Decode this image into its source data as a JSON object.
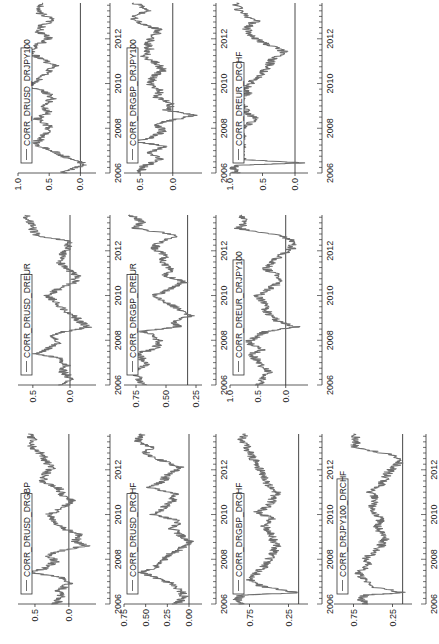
{
  "figure": {
    "orientation": "rotated-90-ccw",
    "line_color": "#6e6e6e",
    "axis_color": "#333333",
    "zero_line_color": "#333333"
  },
  "x_axis": {
    "ticks": [
      "2006",
      "2008",
      "2010",
      "2012"
    ],
    "range": [
      2006,
      2013.6
    ]
  },
  "chart_data": [
    {
      "type": "line",
      "title": "",
      "legend": "CORR_DRUSD_DRGBP",
      "column": 0,
      "row": 0,
      "ylim": [
        -0.4,
        0.75
      ],
      "yticks": [
        "0.5",
        "0.0"
      ],
      "ytick_values": [
        0.5,
        0.0
      ],
      "x": [
        2006.0,
        2006.3,
        2006.6,
        2006.9,
        2007.2,
        2007.4,
        2007.6,
        2007.9,
        2008.2,
        2008.4,
        2008.6,
        2008.8,
        2009.1,
        2009.4,
        2009.7,
        2010.0,
        2010.3,
        2010.6,
        2010.9,
        2011.2,
        2011.5,
        2011.8,
        2012.1,
        2012.4,
        2012.7,
        2013.0,
        2013.3,
        2013.6
      ],
      "values": [
        0.2,
        0.1,
        0.15,
        0.0,
        0.1,
        0.55,
        0.35,
        0.2,
        0.3,
        0.1,
        -0.25,
        -0.1,
        -0.15,
        0.1,
        0.2,
        0.3,
        0.1,
        -0.05,
        0.1,
        0.15,
        0.4,
        0.35,
        0.25,
        0.35,
        0.4,
        0.55,
        0.5,
        0.6
      ]
    },
    {
      "type": "line",
      "legend": "CORR_DRUSD_DRCHF",
      "column": 0,
      "row": 1,
      "ylim": [
        -0.15,
        0.75
      ],
      "yticks": [
        "0.75",
        "0.50",
        "0.25",
        "0.00"
      ],
      "ytick_values": [
        0.75,
        0.5,
        0.25,
        0.0
      ],
      "x": [
        2006.0,
        2006.3,
        2006.6,
        2006.9,
        2007.2,
        2007.4,
        2007.6,
        2007.9,
        2008.2,
        2008.4,
        2008.6,
        2008.8,
        2009.1,
        2009.4,
        2009.7,
        2010.0,
        2010.3,
        2010.6,
        2010.9,
        2011.2,
        2011.5,
        2011.8,
        2012.1,
        2012.4,
        2012.7,
        2013.0,
        2013.3,
        2013.6
      ],
      "values": [
        0.15,
        0.05,
        0.1,
        0.2,
        0.4,
        0.55,
        0.4,
        0.3,
        0.25,
        0.1,
        0.05,
        0.0,
        0.1,
        0.2,
        0.1,
        0.4,
        0.3,
        0.2,
        0.15,
        0.45,
        0.3,
        0.25,
        0.1,
        0.3,
        0.5,
        0.45,
        0.6,
        0.55
      ]
    },
    {
      "type": "line",
      "legend": "CORR_DRGBP_DRCHF",
      "column": 0,
      "row": 2,
      "ylim": [
        0.0,
        1.0
      ],
      "yticks": [
        "0.75",
        "0.25"
      ],
      "ytick_values": [
        0.75,
        0.25
      ],
      "x": [
        2006.0,
        2006.2,
        2006.4,
        2006.5,
        2006.8,
        2007.1,
        2007.4,
        2007.7,
        2008.0,
        2008.3,
        2008.6,
        2008.9,
        2009.2,
        2009.5,
        2009.8,
        2010.1,
        2010.4,
        2010.7,
        2011.0,
        2011.3,
        2011.6,
        2011.9,
        2012.2,
        2012.5,
        2012.8,
        2013.1,
        2013.4,
        2013.6
      ],
      "values": [
        0.85,
        0.9,
        0.85,
        0.12,
        0.6,
        0.75,
        0.65,
        0.55,
        0.5,
        0.45,
        0.4,
        0.45,
        0.5,
        0.55,
        0.45,
        0.65,
        0.5,
        0.45,
        0.4,
        0.5,
        0.55,
        0.6,
        0.65,
        0.7,
        0.75,
        0.8,
        0.85,
        0.8
      ]
    },
    {
      "type": "line",
      "legend": "CORR_DRJPY100_DRCHF",
      "column": 0,
      "row": 3,
      "ylim": [
        0.0,
        1.0
      ],
      "yticks": [
        "0.75",
        "0.25"
      ],
      "ytick_values": [
        0.75,
        0.25
      ],
      "x": [
        2006.0,
        2006.2,
        2006.4,
        2006.5,
        2006.8,
        2007.1,
        2007.4,
        2007.7,
        2008.0,
        2008.3,
        2008.6,
        2008.9,
        2009.2,
        2009.5,
        2009.8,
        2010.1,
        2010.4,
        2010.7,
        2011.0,
        2011.3,
        2011.6,
        2011.9,
        2012.2,
        2012.4,
        2012.7,
        2013.0,
        2013.3,
        2013.6
      ],
      "values": [
        0.6,
        0.65,
        0.6,
        0.1,
        0.55,
        0.6,
        0.7,
        0.55,
        0.6,
        0.5,
        0.4,
        0.35,
        0.4,
        0.45,
        0.4,
        0.5,
        0.5,
        0.45,
        0.55,
        0.4,
        0.35,
        0.3,
        0.2,
        0.15,
        0.3,
        0.75,
        0.7,
        0.75
      ]
    },
    {
      "type": "line",
      "legend": "CORR_DRUSD_DREUR",
      "column": 1,
      "row": 0,
      "ylim": [
        -0.35,
        0.7
      ],
      "yticks": [
        "0.5",
        "0.0"
      ],
      "ytick_values": [
        0.5,
        0.0
      ],
      "x": [
        2006.0,
        2006.3,
        2006.6,
        2006.9,
        2007.2,
        2007.4,
        2007.6,
        2007.9,
        2008.2,
        2008.4,
        2008.6,
        2008.8,
        2009.1,
        2009.4,
        2009.7,
        2010.0,
        2010.3,
        2010.6,
        2010.9,
        2011.2,
        2011.5,
        2011.8,
        2012.1,
        2012.4,
        2012.7,
        2013.0,
        2013.3,
        2013.6
      ],
      "values": [
        0.1,
        0.0,
        0.1,
        0.05,
        0.15,
        0.45,
        0.3,
        0.15,
        0.25,
        0.05,
        -0.25,
        -0.15,
        -0.05,
        0.1,
        0.2,
        0.3,
        0.15,
        -0.05,
        -0.1,
        0.05,
        0.15,
        0.1,
        0.05,
        0.0,
        0.45,
        0.5,
        0.55,
        0.6
      ]
    },
    {
      "type": "line",
      "legend": "CORR_DRGBP_DREUR",
      "column": 1,
      "row": 1,
      "ylim": [
        0.2,
        0.85
      ],
      "yticks": [
        "0.75",
        "0.50",
        "0.25"
      ],
      "ytick_values": [
        0.75,
        0.5,
        0.25
      ],
      "x": [
        2006.0,
        2006.3,
        2006.6,
        2006.9,
        2007.2,
        2007.4,
        2007.6,
        2007.9,
        2008.2,
        2008.4,
        2008.6,
        2008.8,
        2009.1,
        2009.4,
        2009.7,
        2010.0,
        2010.3,
        2010.6,
        2010.9,
        2011.2,
        2011.5,
        2011.8,
        2012.1,
        2012.4,
        2012.7,
        2013.0,
        2013.3,
        2013.6
      ],
      "values": [
        0.7,
        0.72,
        0.8,
        0.65,
        0.7,
        0.75,
        0.6,
        0.55,
        0.6,
        0.7,
        0.4,
        0.45,
        0.3,
        0.4,
        0.5,
        0.6,
        0.45,
        0.35,
        0.5,
        0.45,
        0.55,
        0.5,
        0.6,
        0.55,
        0.4,
        0.75,
        0.7,
        0.8
      ]
    },
    {
      "type": "line",
      "legend": "CORR_DREUR_DRJPY100",
      "column": 1,
      "row": 2,
      "ylim": [
        -0.4,
        1.0
      ],
      "yticks": [
        "1.0",
        "0.5",
        "0.0"
      ],
      "ytick_values": [
        1.0,
        0.5,
        0.0
      ],
      "x": [
        2006.0,
        2006.3,
        2006.6,
        2006.9,
        2007.2,
        2007.4,
        2007.6,
        2007.9,
        2008.2,
        2008.4,
        2008.6,
        2008.8,
        2009.1,
        2009.4,
        2009.7,
        2010.0,
        2010.3,
        2010.6,
        2010.9,
        2011.2,
        2011.5,
        2011.8,
        2012.1,
        2012.4,
        2012.7,
        2013.0,
        2013.3,
        2013.6
      ],
      "values": [
        0.5,
        0.4,
        0.3,
        0.45,
        0.55,
        0.6,
        0.4,
        0.7,
        0.5,
        0.35,
        -0.2,
        0.1,
        0.3,
        0.35,
        0.4,
        0.5,
        0.3,
        0.1,
        0.15,
        0.35,
        0.25,
        0.1,
        -0.1,
        -0.15,
        0.1,
        0.85,
        0.7,
        0.8
      ]
    },
    {
      "type": "line",
      "legend": "CORR_DRUSD_DRJPY100",
      "column": 2,
      "row": 0,
      "ylim": [
        -0.25,
        1.0
      ],
      "yticks": [
        "1.0",
        "0.5",
        "0.0"
      ],
      "ytick_values": [
        1.0,
        0.5,
        0.0
      ],
      "x": [
        2006.0,
        2006.2,
        2006.4,
        2006.6,
        2006.8,
        2007.0,
        2007.3,
        2007.5,
        2007.8,
        2008.1,
        2008.4,
        2008.7,
        2009.0,
        2009.3,
        2009.6,
        2009.9,
        2010.2,
        2010.5,
        2010.8,
        2011.1,
        2011.4,
        2011.7,
        2012.0,
        2012.3,
        2012.6,
        2012.9,
        2013.2,
        2013.6
      ],
      "values": [
        0.3,
        0.1,
        -0.1,
        0.15,
        0.3,
        0.45,
        0.75,
        0.65,
        0.55,
        0.5,
        0.7,
        0.5,
        0.6,
        0.45,
        0.55,
        0.85,
        0.65,
        0.55,
        0.4,
        0.65,
        0.8,
        0.7,
        0.5,
        0.65,
        0.6,
        0.45,
        0.7,
        0.6
      ]
    },
    {
      "type": "line",
      "legend": "CORR_DRGBP_DRJPY100",
      "column": 2,
      "row": 1,
      "ylim": [
        -0.45,
        0.75
      ],
      "yticks": [
        "0.5",
        "0.0"
      ],
      "ytick_values": [
        0.5,
        0.0
      ],
      "x": [
        2006.0,
        2006.3,
        2006.6,
        2006.9,
        2007.2,
        2007.4,
        2007.6,
        2007.9,
        2008.2,
        2008.4,
        2008.6,
        2008.8,
        2009.1,
        2009.4,
        2009.7,
        2010.0,
        2010.3,
        2010.6,
        2010.9,
        2011.2,
        2011.5,
        2011.8,
        2012.1,
        2012.4,
        2012.7,
        2013.0,
        2013.3,
        2013.6
      ],
      "values": [
        0.5,
        0.45,
        0.2,
        0.35,
        0.1,
        0.6,
        0.3,
        0.15,
        0.25,
        -0.05,
        -0.35,
        0.1,
        0.0,
        0.25,
        0.2,
        0.35,
        0.3,
        0.15,
        0.25,
        0.45,
        0.35,
        0.4,
        0.3,
        0.2,
        0.5,
        0.65,
        0.35,
        0.6
      ]
    },
    {
      "type": "line",
      "legend": "CORR_DREUR_DRCHF",
      "column": 2,
      "row": 2,
      "ylim": [
        -0.2,
        1.0
      ],
      "yticks": [
        "1.0",
        "0.5",
        "0.0"
      ],
      "ytick_values": [
        1.0,
        0.5,
        0.0
      ],
      "x": [
        2006.0,
        2006.2,
        2006.35,
        2006.45,
        2006.6,
        2006.9,
        2007.2,
        2007.5,
        2007.8,
        2008.1,
        2008.4,
        2008.7,
        2009.0,
        2009.3,
        2009.6,
        2009.9,
        2010.2,
        2010.5,
        2010.8,
        2011.1,
        2011.4,
        2011.6,
        2011.9,
        2012.2,
        2012.5,
        2012.8,
        2013.2,
        2013.6
      ],
      "values": [
        0.9,
        0.95,
        0.9,
        -0.15,
        0.8,
        0.85,
        0.82,
        0.8,
        0.85,
        0.75,
        0.6,
        0.75,
        0.8,
        0.85,
        0.7,
        0.75,
        0.6,
        0.5,
        0.4,
        0.35,
        0.15,
        0.3,
        0.55,
        0.7,
        0.75,
        0.6,
        0.85,
        0.9
      ]
    }
  ]
}
